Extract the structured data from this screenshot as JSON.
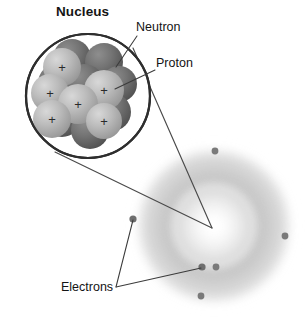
{
  "figure": {
    "title_label": "Nucleus",
    "labels": {
      "nucleus": "Nucleus",
      "neutron": "Neutron",
      "proton": "Proton",
      "electrons": "Electrons"
    },
    "colors": {
      "background": "#ffffff",
      "line": "#3b3b3b",
      "text": "#141414",
      "neutron_dark": "#6f6f6f",
      "neutron_dark_edge": "#4a4a4a",
      "proton_light": "#b4b4b4",
      "proton_light_edge": "#8c8c8c",
      "electron_dot": "#7a7a7a",
      "cloud_grey": "#c9c9c9",
      "nucleus_ring": "#2e2e2e"
    },
    "nucleus_circle": {
      "cx": 88,
      "cy": 96,
      "r": 62,
      "stroke_width": 2.2
    },
    "charge_symbol": "+",
    "nucleons": [
      {
        "type": "neutron",
        "cx": 72,
        "cy": 58,
        "r": 19
      },
      {
        "type": "neutron",
        "cx": 104,
        "cy": 62,
        "r": 19
      },
      {
        "type": "neutron",
        "cx": 119,
        "cy": 84,
        "r": 18
      },
      {
        "type": "neutron",
        "cx": 57,
        "cy": 83,
        "r": 19
      },
      {
        "type": "neutron",
        "cx": 84,
        "cy": 84,
        "r": 20
      },
      {
        "type": "neutron",
        "cx": 112,
        "cy": 112,
        "r": 19
      },
      {
        "type": "neutron",
        "cx": 62,
        "cy": 118,
        "r": 19
      },
      {
        "type": "neutron",
        "cx": 90,
        "cy": 130,
        "r": 19
      },
      {
        "type": "proton",
        "cx": 62,
        "cy": 67,
        "r": 19
      },
      {
        "type": "proton",
        "cx": 50,
        "cy": 93,
        "r": 19
      },
      {
        "type": "proton",
        "cx": 104,
        "cy": 90,
        "r": 20
      },
      {
        "type": "proton",
        "cx": 78,
        "cy": 104,
        "r": 20
      },
      {
        "type": "proton",
        "cx": 52,
        "cy": 119,
        "r": 19
      },
      {
        "type": "proton",
        "cx": 104,
        "cy": 121,
        "r": 18
      }
    ],
    "electron_cloud": {
      "cx": 214,
      "cy": 226,
      "outer_r": 82,
      "ring_r": 58,
      "ring_width": 30
    },
    "electrons": [
      {
        "cx": 215,
        "cy": 151
      },
      {
        "cx": 285,
        "cy": 236
      },
      {
        "cx": 133,
        "cy": 219
      },
      {
        "cx": 202,
        "cy": 267
      },
      {
        "cx": 216,
        "cy": 267
      },
      {
        "cx": 201,
        "cy": 296
      }
    ],
    "leader_lines": {
      "neutron": {
        "x1": 137,
        "y1": 36,
        "x2": 116,
        "y2": 67
      },
      "proton": {
        "x1": 155,
        "y1": 70,
        "x2": 115,
        "y2": 89
      },
      "zoom_upper": {
        "x1": 133,
        "y1": 48,
        "x2": 212,
        "y2": 228
      },
      "zoom_lower": {
        "x1": 55,
        "y1": 152,
        "x2": 212,
        "y2": 228
      },
      "electrons_vertex": {
        "x": 116,
        "y": 287
      },
      "electrons_to_left": {
        "x": 133,
        "y": 220
      },
      "electrons_to_bottom": {
        "x": 201,
        "y": 268
      }
    }
  }
}
